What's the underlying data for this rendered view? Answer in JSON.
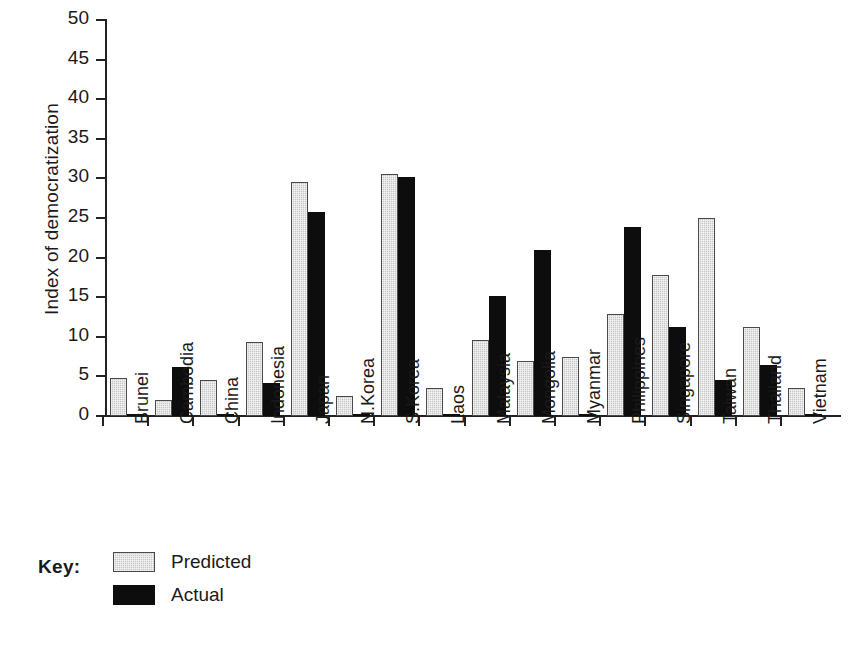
{
  "chart_data": {
    "type": "bar",
    "title": "",
    "xlabel": "",
    "ylabel": "Index of democratization",
    "ylim": [
      0,
      50
    ],
    "yticks": [
      0,
      5,
      10,
      15,
      20,
      25,
      30,
      35,
      40,
      45,
      50
    ],
    "grid": false,
    "legend_position": "bottom-left",
    "legend_title": "Key:",
    "categories": [
      "Brunei",
      "Cambodia",
      "China",
      "Indonesia",
      "Japan",
      "N.Korea",
      "S.Korea",
      "Laos",
      "Malaysia",
      "Mongolia",
      "Myanmar",
      "Philippines",
      "Singapore",
      "Taiwan",
      "Thailand",
      "Vietnam"
    ],
    "series": [
      {
        "name": "Predicted",
        "color": "#c6c6c6",
        "values": [
          4.8,
          2.0,
          4.5,
          9.4,
          29.5,
          2.5,
          30.5,
          3.6,
          9.6,
          7.0,
          7.5,
          12.9,
          17.8,
          25.0,
          11.3,
          3.5
        ]
      },
      {
        "name": "Actual",
        "color": "#0d0d0d",
        "values": [
          0.3,
          6.2,
          0.3,
          4.2,
          25.8,
          0.3,
          30.2,
          0.2,
          15.2,
          21.0,
          0.3,
          23.9,
          11.3,
          4.6,
          6.4,
          0.2
        ]
      }
    ]
  },
  "legend": {
    "title": "Key:",
    "entries": [
      {
        "label": "Predicted"
      },
      {
        "label": "Actual"
      }
    ]
  }
}
